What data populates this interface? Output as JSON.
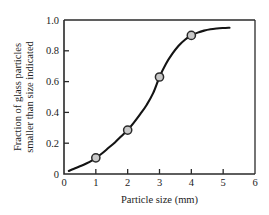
{
  "chart_data": {
    "type": "line",
    "title": "",
    "subtitle": "",
    "xlabel": "Particle size (mm)",
    "ylabel": "Fraction of glass particles smaller than size indicated",
    "ylabel_lines": [
      "Fraction of glass particles",
      "smaller than size indicated"
    ],
    "xlim": [
      0,
      6
    ],
    "ylim": [
      0,
      1.0
    ],
    "xticks": [
      0,
      1,
      2,
      3,
      4,
      5,
      6
    ],
    "xtick_labels": [
      "0",
      "1",
      "2",
      "3",
      "4",
      "5",
      "6"
    ],
    "yticks": [
      0,
      0.2,
      0.4,
      0.6,
      0.8,
      1.0
    ],
    "ytick_labels": [
      "0",
      "0.2",
      "0.4",
      "0.6",
      "0.8",
      "1.0"
    ],
    "grid": false,
    "legend": false,
    "legend_position": "none",
    "series": [
      {
        "name": "Cumulative fraction smaller than size",
        "marker_x": [
          1,
          2,
          3,
          4
        ],
        "marker_y": [
          0.105,
          0.285,
          0.63,
          0.9
        ],
        "marker_labels": [
          "0.105",
          "0.285",
          "0.63",
          "0.90"
        ],
        "curve_x": [
          0.15,
          0.3,
          0.5,
          0.7,
          0.9,
          1.0,
          1.2,
          1.4,
          1.6,
          1.8,
          2.0,
          2.2,
          2.4,
          2.6,
          2.8,
          3.0,
          3.2,
          3.4,
          3.6,
          3.8,
          4.0,
          4.2,
          4.4,
          4.6,
          4.8,
          5.0,
          5.2
        ],
        "curve_y": [
          0.02,
          0.033,
          0.05,
          0.068,
          0.09,
          0.105,
          0.135,
          0.17,
          0.205,
          0.245,
          0.285,
          0.335,
          0.39,
          0.45,
          0.525,
          0.63,
          0.715,
          0.78,
          0.833,
          0.872,
          0.9,
          0.918,
          0.931,
          0.94,
          0.945,
          0.948,
          0.95
        ],
        "line_color": "#141414",
        "marker_fill": "#c9c9c9",
        "marker_edge": "#2b2b2b"
      }
    ],
    "axis_color": "#2a2a2a",
    "background_color": "#ffffff"
  }
}
